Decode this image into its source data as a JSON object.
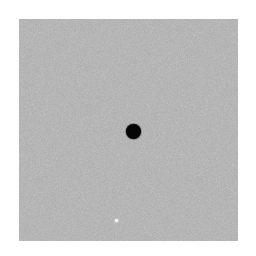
{
  "image": {
    "background_color": "#ffffff",
    "field": {
      "x": 19,
      "y": 19,
      "width": 219,
      "height": 222,
      "color": "#a9a9a9",
      "texture": "fine-grain-noise"
    },
    "objects": [
      {
        "name": "black-dot",
        "cx": 133.5,
        "cy": 131.5,
        "diameter": 15,
        "color": "#050505"
      },
      {
        "name": "white-speck",
        "cx": 116.5,
        "cy": 220.5,
        "diameter": 3,
        "color": "#f2f2f2"
      }
    ]
  }
}
